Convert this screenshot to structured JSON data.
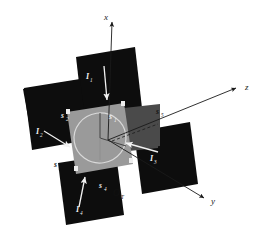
{
  "figure": {
    "background_color": "#ffffff",
    "panel_dark_color": "#0d0d0d",
    "panel_mid_color": "#4a4a4a",
    "panel_center_color": "#9a9a9a",
    "axis_color": "#1a1a1a",
    "arrow_light_color": "#f2f2f2",
    "circle_color": "#d9d9d9"
  },
  "axes": [
    {
      "id": "x",
      "label": "x",
      "direction": "up"
    },
    {
      "id": "y",
      "label": "y",
      "direction": "down-right"
    },
    {
      "id": "z",
      "label": "z",
      "direction": "up-right"
    }
  ],
  "origin": {
    "label": "O",
    "subscript": "T"
  },
  "surfaces": [
    {
      "id": "s1",
      "label": "s",
      "subscript": "1",
      "tone": "dark"
    },
    {
      "id": "s2",
      "label": "s",
      "subscript": "2",
      "tone": "dark"
    },
    {
      "id": "s3",
      "label": "s",
      "subscript": "3",
      "tone": "light"
    },
    {
      "id": "s4",
      "label": "s",
      "subscript": "4",
      "tone": "light"
    },
    {
      "id": "s5",
      "label": "s",
      "subscript": "5",
      "tone": "light"
    }
  ],
  "vectors": [
    {
      "id": "I1",
      "label": "I",
      "subscript": "1",
      "panel": "top",
      "direction": "down"
    },
    {
      "id": "I2",
      "label": "I",
      "subscript": "2",
      "panel": "left",
      "direction": "down-right"
    },
    {
      "id": "I3",
      "label": "I",
      "subscript": "3",
      "panel": "right",
      "direction": "left"
    },
    {
      "id": "I4",
      "label": "I",
      "subscript": "4",
      "panel": "bottom",
      "direction": "up"
    }
  ]
}
